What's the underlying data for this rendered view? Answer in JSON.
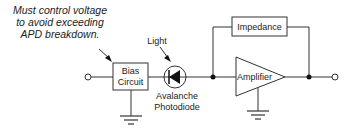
{
  "diagram": {
    "annotation": {
      "lines": [
        "Must control voltage",
        "to avoid exceeding",
        "APD breakdown."
      ]
    },
    "light_label": "Light",
    "bias_box": {
      "lines": [
        "Bias",
        "Circuit"
      ]
    },
    "photodiode_label": {
      "lines": [
        "Avalanche",
        "Photodiode"
      ]
    },
    "impedance_label": "Impedance",
    "amplifier_label": "Amplifier",
    "colors": {
      "stroke": "#333333",
      "fill": "#ffffff",
      "text": "#222222"
    }
  }
}
